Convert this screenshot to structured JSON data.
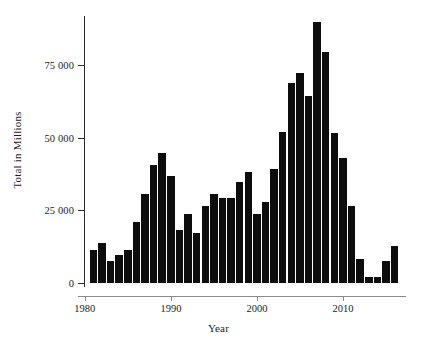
{
  "chart_data": {
    "type": "bar",
    "title": "",
    "xlabel": "Year",
    "ylabel": "Total in Millions",
    "xlim": [
      1979.9,
      2017.1
    ],
    "ylim": [
      0,
      92000
    ],
    "grid": false,
    "legend": null,
    "bar_color": "#0d0d0d",
    "axis_color": "#2b2b2b",
    "xticks": [
      1980,
      1990,
      2000,
      2010
    ],
    "xtick_labels": [
      "1980",
      "1990",
      "2000",
      "2010"
    ],
    "yticks": [
      0,
      25000,
      50000,
      75000
    ],
    "ytick_labels": [
      "0",
      "25 000",
      "50 000",
      "75 000"
    ],
    "categories": [
      1981,
      1982,
      1983,
      1984,
      1985,
      1986,
      1987,
      1988,
      1989,
      1990,
      1991,
      1992,
      1993,
      1994,
      1995,
      1996,
      1997,
      1998,
      1999,
      2000,
      2001,
      2002,
      2003,
      2004,
      2005,
      2006,
      2007,
      2008,
      2009,
      2010,
      2011,
      2012,
      2013,
      2014,
      2015,
      2016
    ],
    "values": [
      11500,
      13800,
      7400,
      9700,
      11200,
      21000,
      30500,
      40500,
      44800,
      36800,
      18400,
      23900,
      17200,
      26400,
      30500,
      29200,
      29200,
      34700,
      38300,
      23900,
      27700,
      39300,
      52000,
      68700,
      72100,
      64400,
      89800,
      79400,
      51600,
      43000,
      26500,
      8200,
      2100,
      2000,
      7600,
      12600
    ]
  },
  "figure": {
    "width": 437,
    "height": 346,
    "background": "#ffffff"
  }
}
